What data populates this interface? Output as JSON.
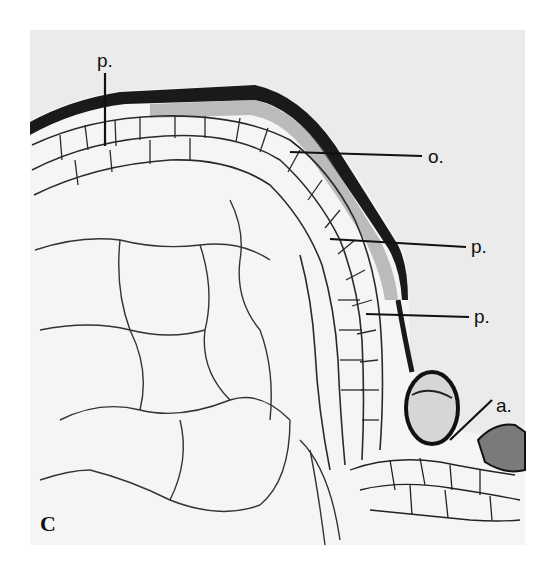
{
  "figure": {
    "panel_letter": "C",
    "background_color": "#ffffff",
    "photo_color": "#ebebeb",
    "tissue_dark": "#1a1a1a",
    "labels": [
      {
        "id": "p-top",
        "text": "p.",
        "x": 97,
        "y": 72
      },
      {
        "id": "o",
        "text": "o.",
        "x": 428,
        "y": 168
      },
      {
        "id": "p-mid",
        "text": "p.",
        "x": 471,
        "y": 253
      },
      {
        "id": "p-lower",
        "text": "p.",
        "x": 474,
        "y": 323
      },
      {
        "id": "a",
        "text": "a.",
        "x": 496,
        "y": 414
      }
    ]
  }
}
